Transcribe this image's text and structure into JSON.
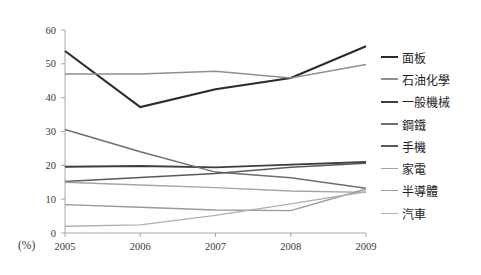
{
  "chart_data": {
    "type": "line",
    "title": "",
    "xlabel": "",
    "ylabel": "",
    "unit_label": "(%)",
    "categories": [
      "2005",
      "2006",
      "2007",
      "2008",
      "2009"
    ],
    "x": [
      2005,
      2006,
      2007,
      2008,
      2009
    ],
    "ylim": [
      0,
      60
    ],
    "yticks": [
      0,
      10,
      20,
      30,
      40,
      50,
      60
    ],
    "ytick_labels": [
      "0",
      "10",
      "20",
      "30",
      "40",
      "50",
      "60"
    ],
    "grid": false,
    "legend_position": "right",
    "series": [
      {
        "name": "面板",
        "color": "#2b2b2b",
        "width": 2.1,
        "values": [
          53.8,
          37.2,
          42.5,
          45.8,
          55.2
        ]
      },
      {
        "name": "石油化學",
        "color": "#8f8f8f",
        "width": 1.5,
        "values": [
          47.0,
          47.0,
          47.8,
          45.8,
          49.8
        ]
      },
      {
        "name": "一般機械",
        "color": "#3d3d3d",
        "width": 1.9,
        "values": [
          19.6,
          19.8,
          19.4,
          20.2,
          21.0
        ]
      },
      {
        "name": "鋼鐵",
        "color": "#6e6e6e",
        "width": 1.5,
        "values": [
          30.6,
          24.0,
          18.0,
          16.3,
          13.2
        ]
      },
      {
        "name": "手機",
        "color": "#5a5a5a",
        "width": 1.5,
        "values": [
          15.2,
          16.4,
          17.6,
          19.4,
          20.6
        ]
      },
      {
        "name": "家電",
        "color": "#a5a5a5",
        "width": 1.4,
        "values": [
          15.0,
          14.2,
          13.4,
          12.4,
          12.0
        ]
      },
      {
        "name": "半導體",
        "color": "#9a9a9a",
        "width": 1.4,
        "values": [
          8.4,
          7.6,
          6.8,
          6.6,
          13.0
        ]
      },
      {
        "name": "汽車",
        "color": "#b0b0b0",
        "width": 1.4,
        "values": [
          2.0,
          2.4,
          5.2,
          8.6,
          12.2
        ]
      }
    ]
  },
  "legend": {
    "items": [
      {
        "label": "面板"
      },
      {
        "label": "石油化學"
      },
      {
        "label": "一般機械"
      },
      {
        "label": "鋼鐵"
      },
      {
        "label": "手機"
      },
      {
        "label": "家電"
      },
      {
        "label": "半導體"
      },
      {
        "label": "汽車"
      }
    ]
  }
}
